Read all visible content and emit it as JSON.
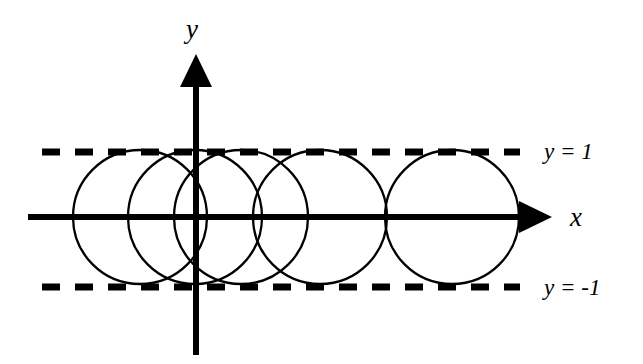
{
  "figure": {
    "width": 643,
    "height": 364,
    "background_color": "#ffffff",
    "stroke_color": "#000000"
  },
  "axes": {
    "x_axis": {
      "label": "x",
      "label_position": {
        "x": 570,
        "y": 204
      },
      "line": {
        "x1": 28,
        "y1": 217,
        "x2": 528,
        "y2": 217
      },
      "arrow_tip": {
        "x": 552,
        "y": 217
      },
      "stroke_width": 6
    },
    "y_axis": {
      "label": "y",
      "label_position": {
        "x": 186,
        "y": 16
      },
      "line": {
        "x1": 196,
        "y1": 355,
        "x2": 196,
        "y2": 78
      },
      "arrow_tip": {
        "x": 196,
        "y": 54
      },
      "stroke_width": 6
    },
    "origin": {
      "x": 196,
      "y": 217
    }
  },
  "guide_lines": [
    {
      "name": "upper-bound",
      "label": "y = 1",
      "y_value": 1,
      "y_pixel": 152,
      "x_start": 42,
      "x_end": 520,
      "dash": "18 15",
      "stroke_width": 7,
      "label_position": {
        "x": 544,
        "y": 140
      }
    },
    {
      "name": "lower-bound",
      "label": "y = -1",
      "y_value": -1,
      "y_pixel": 287,
      "x_start": 42,
      "x_end": 520,
      "dash": "18 15",
      "stroke_width": 7,
      "label_position": {
        "x": 544,
        "y": 276
      }
    }
  ],
  "chart_data": {
    "type": "scatter",
    "title": "",
    "xlabel": "x",
    "ylabel": "y",
    "circle_radius_pixels": 67,
    "circle_radius_units": 1,
    "circles": [
      {
        "name": "circle-1",
        "cx": 140,
        "cy": 217,
        "r": 67
      },
      {
        "name": "circle-2",
        "cx": 195,
        "cy": 217,
        "r": 67
      },
      {
        "name": "circle-3",
        "cx": 241,
        "cy": 217,
        "r": 67
      },
      {
        "name": "circle-4",
        "cx": 320,
        "cy": 217,
        "r": 67
      },
      {
        "name": "circle-5",
        "cx": 452,
        "cy": 217,
        "r": 67
      }
    ],
    "grid": false,
    "legend": "none"
  }
}
